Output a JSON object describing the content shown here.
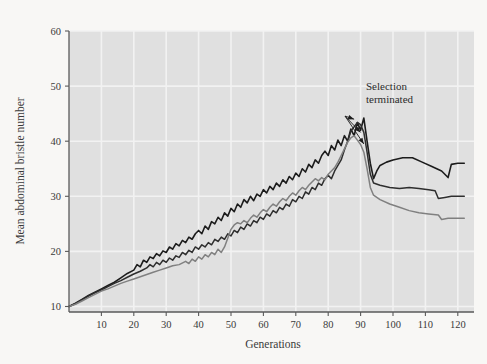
{
  "figure": {
    "background_color": "#f8f7f5",
    "plot_background_color": "#e0e0e0",
    "gridline_color": "#f2f2f2",
    "axis_color": "#5a5a5a"
  },
  "annotation": {
    "line1": "Selection",
    "line2": "terminated"
  },
  "chart_data": {
    "type": "line",
    "title": "",
    "xlabel": "Generations",
    "ylabel": "Mean abdominal bristle number",
    "xlim": [
      0,
      125
    ],
    "ylim": [
      9,
      60
    ],
    "xticks": [
      10,
      20,
      30,
      40,
      50,
      60,
      70,
      80,
      90,
      100,
      110,
      120
    ],
    "yticks": [
      10,
      20,
      30,
      40,
      50,
      60
    ],
    "grid": true,
    "legend": false,
    "annotations": [
      {
        "text": "Selection terminated",
        "x": 96,
        "y": 50,
        "points": [
          {
            "x": 88,
            "y": 44.0
          },
          {
            "x": 90,
            "y": 41.6
          },
          {
            "x": 91,
            "y": 39.5
          }
        ]
      }
    ],
    "series": [
      {
        "name": "line-a",
        "color": "#1c1c1c",
        "width": 1.6,
        "points": [
          [
            0,
            10.0
          ],
          [
            2,
            10.6
          ],
          [
            4,
            11.3
          ],
          [
            6,
            12.0
          ],
          [
            8,
            12.6
          ],
          [
            10,
            13.2
          ],
          [
            12,
            13.8
          ],
          [
            14,
            14.4
          ],
          [
            16,
            15.2
          ],
          [
            18,
            16.0
          ],
          [
            20,
            16.6
          ],
          [
            21,
            17.6
          ],
          [
            22,
            17.2
          ],
          [
            23,
            18.4
          ],
          [
            24,
            18.0
          ],
          [
            25,
            19.0
          ],
          [
            26,
            18.7
          ],
          [
            27,
            19.6
          ],
          [
            28,
            19.2
          ],
          [
            29,
            20.1
          ],
          [
            30,
            19.8
          ],
          [
            31,
            20.8
          ],
          [
            32,
            20.4
          ],
          [
            33,
            21.4
          ],
          [
            34,
            21.0
          ],
          [
            35,
            22.0
          ],
          [
            36,
            21.6
          ],
          [
            37,
            22.6
          ],
          [
            38,
            22.2
          ],
          [
            39,
            23.2
          ],
          [
            40,
            23.8
          ],
          [
            41,
            23.2
          ],
          [
            42,
            24.6
          ],
          [
            43,
            24.0
          ],
          [
            44,
            25.4
          ],
          [
            45,
            25.0
          ],
          [
            46,
            26.2
          ],
          [
            47,
            25.6
          ],
          [
            48,
            27.0
          ],
          [
            49,
            26.4
          ],
          [
            50,
            27.8
          ],
          [
            51,
            27.2
          ],
          [
            52,
            28.6
          ],
          [
            53,
            28.0
          ],
          [
            54,
            29.4
          ],
          [
            55,
            28.8
          ],
          [
            56,
            30.0
          ],
          [
            57,
            29.2
          ],
          [
            58,
            30.4
          ],
          [
            59,
            30.0
          ],
          [
            60,
            31.2
          ],
          [
            61,
            30.6
          ],
          [
            62,
            31.8
          ],
          [
            63,
            31.2
          ],
          [
            64,
            32.4
          ],
          [
            65,
            31.8
          ],
          [
            66,
            33.0
          ],
          [
            67,
            32.4
          ],
          [
            68,
            33.6
          ],
          [
            69,
            33.0
          ],
          [
            70,
            34.2
          ],
          [
            71,
            33.6
          ],
          [
            72,
            35.0
          ],
          [
            73,
            34.4
          ],
          [
            74,
            35.8
          ],
          [
            75,
            35.2
          ],
          [
            76,
            36.6
          ],
          [
            77,
            36.0
          ],
          [
            78,
            37.4
          ],
          [
            79,
            38.2
          ],
          [
            80,
            37.4
          ],
          [
            81,
            39.2
          ],
          [
            82,
            38.4
          ],
          [
            83,
            40.2
          ],
          [
            84,
            39.2
          ],
          [
            85,
            41.0
          ],
          [
            86,
            40.0
          ],
          [
            87,
            42.2
          ],
          [
            88,
            41.0
          ],
          [
            89,
            43.4
          ],
          [
            90,
            42.0
          ],
          [
            91,
            44.2
          ],
          [
            92,
            40.0
          ],
          [
            93,
            36.0
          ],
          [
            94,
            33.2
          ],
          [
            95,
            34.6
          ],
          [
            96,
            35.6
          ],
          [
            98,
            36.2
          ],
          [
            100,
            36.6
          ],
          [
            103,
            37.0
          ],
          [
            106,
            37.0
          ],
          [
            109,
            36.2
          ],
          [
            112,
            35.4
          ],
          [
            115,
            34.6
          ],
          [
            117,
            33.4
          ],
          [
            118,
            35.8
          ],
          [
            120,
            36.0
          ],
          [
            122,
            36.0
          ]
        ]
      },
      {
        "name": "line-b",
        "color": "#2e2e2e",
        "width": 1.5,
        "points": [
          [
            0,
            10.0
          ],
          [
            2,
            10.5
          ],
          [
            4,
            11.2
          ],
          [
            6,
            11.9
          ],
          [
            8,
            12.5
          ],
          [
            10,
            13.0
          ],
          [
            12,
            13.6
          ],
          [
            14,
            14.2
          ],
          [
            16,
            14.7
          ],
          [
            18,
            15.3
          ],
          [
            20,
            15.9
          ],
          [
            22,
            16.4
          ],
          [
            24,
            17.0
          ],
          [
            25,
            17.6
          ],
          [
            26,
            17.2
          ],
          [
            27,
            18.0
          ],
          [
            28,
            17.6
          ],
          [
            29,
            18.4
          ],
          [
            30,
            18.0
          ],
          [
            31,
            18.8
          ],
          [
            32,
            18.4
          ],
          [
            33,
            19.2
          ],
          [
            34,
            18.9
          ],
          [
            35,
            19.8
          ],
          [
            36,
            19.4
          ],
          [
            37,
            20.2
          ],
          [
            38,
            19.8
          ],
          [
            39,
            20.8
          ],
          [
            40,
            20.4
          ],
          [
            41,
            21.2
          ],
          [
            42,
            20.8
          ],
          [
            43,
            21.6
          ],
          [
            44,
            21.2
          ],
          [
            45,
            22.2
          ],
          [
            46,
            21.8
          ],
          [
            47,
            22.6
          ],
          [
            48,
            22.2
          ],
          [
            49,
            23.2
          ],
          [
            50,
            22.8
          ],
          [
            51,
            23.8
          ],
          [
            52,
            23.4
          ],
          [
            53,
            24.4
          ],
          [
            54,
            24.0
          ],
          [
            55,
            25.0
          ],
          [
            56,
            24.6
          ],
          [
            57,
            25.6
          ],
          [
            58,
            25.2
          ],
          [
            59,
            26.2
          ],
          [
            60,
            25.8
          ],
          [
            61,
            26.8
          ],
          [
            62,
            26.4
          ],
          [
            63,
            27.4
          ],
          [
            64,
            27.0
          ],
          [
            65,
            28.0
          ],
          [
            66,
            27.6
          ],
          [
            67,
            28.6
          ],
          [
            68,
            28.2
          ],
          [
            69,
            29.4
          ],
          [
            70,
            29.0
          ],
          [
            71,
            30.0
          ],
          [
            72,
            29.6
          ],
          [
            73,
            30.8
          ],
          [
            74,
            30.4
          ],
          [
            75,
            31.6
          ],
          [
            76,
            31.2
          ],
          [
            77,
            32.4
          ],
          [
            78,
            32.0
          ],
          [
            79,
            33.2
          ],
          [
            80,
            33.8
          ],
          [
            81,
            33.2
          ],
          [
            82,
            34.6
          ],
          [
            83,
            35.6
          ],
          [
            84,
            36.6
          ],
          [
            85,
            38.4
          ],
          [
            86,
            40.0
          ],
          [
            87,
            41.8
          ],
          [
            88,
            42.6
          ],
          [
            89,
            43.4
          ],
          [
            90,
            43.0
          ],
          [
            91,
            41.6
          ],
          [
            92,
            38.0
          ],
          [
            93,
            34.0
          ],
          [
            94,
            32.4
          ],
          [
            96,
            32.0
          ],
          [
            99,
            31.6
          ],
          [
            102,
            31.4
          ],
          [
            105,
            31.6
          ],
          [
            108,
            31.4
          ],
          [
            111,
            31.2
          ],
          [
            113,
            31.0
          ],
          [
            114,
            29.6
          ],
          [
            116,
            29.8
          ],
          [
            118,
            30.0
          ],
          [
            120,
            30.0
          ],
          [
            122,
            30.0
          ]
        ]
      },
      {
        "name": "line-c",
        "color": "#808080",
        "width": 1.5,
        "points": [
          [
            0,
            10.0
          ],
          [
            2,
            10.4
          ],
          [
            4,
            11.0
          ],
          [
            6,
            11.6
          ],
          [
            8,
            12.2
          ],
          [
            10,
            12.8
          ],
          [
            12,
            13.2
          ],
          [
            14,
            13.7
          ],
          [
            16,
            14.2
          ],
          [
            18,
            14.6
          ],
          [
            20,
            15.0
          ],
          [
            22,
            15.4
          ],
          [
            24,
            15.8
          ],
          [
            26,
            16.2
          ],
          [
            28,
            16.6
          ],
          [
            30,
            17.0
          ],
          [
            32,
            17.4
          ],
          [
            34,
            17.6
          ],
          [
            36,
            18.2
          ],
          [
            37,
            17.8
          ],
          [
            38,
            18.6
          ],
          [
            39,
            18.2
          ],
          [
            40,
            19.0
          ],
          [
            41,
            18.6
          ],
          [
            42,
            19.4
          ],
          [
            43,
            19.0
          ],
          [
            44,
            19.8
          ],
          [
            45,
            19.4
          ],
          [
            46,
            20.4
          ],
          [
            47,
            19.8
          ],
          [
            48,
            20.8
          ],
          [
            49,
            22.4
          ],
          [
            50,
            24.0
          ],
          [
            51,
            24.8
          ],
          [
            52,
            25.2
          ],
          [
            53,
            25.0
          ],
          [
            54,
            25.6
          ],
          [
            55,
            25.2
          ],
          [
            56,
            26.0
          ],
          [
            57,
            26.6
          ],
          [
            58,
            26.2
          ],
          [
            59,
            27.0
          ],
          [
            60,
            27.6
          ],
          [
            61,
            27.2
          ],
          [
            62,
            28.0
          ],
          [
            63,
            28.6
          ],
          [
            64,
            28.2
          ],
          [
            65,
            29.0
          ],
          [
            66,
            29.6
          ],
          [
            67,
            29.2
          ],
          [
            68,
            30.0
          ],
          [
            69,
            30.6
          ],
          [
            70,
            30.2
          ],
          [
            71,
            31.0
          ],
          [
            72,
            31.6
          ],
          [
            73,
            31.2
          ],
          [
            74,
            32.0
          ],
          [
            75,
            32.6
          ],
          [
            76,
            33.2
          ],
          [
            77,
            32.8
          ],
          [
            78,
            33.4
          ],
          [
            79,
            33.0
          ],
          [
            80,
            34.0
          ],
          [
            81,
            34.6
          ],
          [
            82,
            35.2
          ],
          [
            83,
            36.2
          ],
          [
            84,
            37.4
          ],
          [
            85,
            38.6
          ],
          [
            86,
            39.8
          ],
          [
            87,
            40.6
          ],
          [
            88,
            41.0
          ],
          [
            89,
            40.2
          ],
          [
            90,
            39.4
          ],
          [
            91,
            38.0
          ],
          [
            92,
            35.0
          ],
          [
            93,
            31.6
          ],
          [
            94,
            30.2
          ],
          [
            96,
            29.4
          ],
          [
            99,
            28.6
          ],
          [
            102,
            28.0
          ],
          [
            105,
            27.4
          ],
          [
            108,
            27.0
          ],
          [
            111,
            26.8
          ],
          [
            114,
            26.6
          ],
          [
            115,
            25.8
          ],
          [
            117,
            26.0
          ],
          [
            119,
            26.0
          ],
          [
            121,
            26.0
          ],
          [
            122,
            26.0
          ]
        ]
      }
    ]
  }
}
